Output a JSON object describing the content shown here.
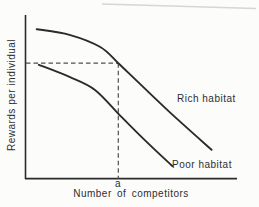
{
  "figure": {
    "background": "#fcfcfb",
    "line_color": "#2b2b2b",
    "dash_color": "#4f4f4f",
    "text_color": "#2e2e2e",
    "scan_artifact_color": "#d2d2d2"
  },
  "chart_data": {
    "type": "line",
    "title": "",
    "xlabel": "Number of competitors",
    "ylabel": "Rewards per individual",
    "xlim": [
      0,
      10
    ],
    "ylim": [
      0,
      10
    ],
    "grid": false,
    "axes_numeric": false,
    "legend_position": "labels-beside-curves",
    "series": [
      {
        "name": "Rich habitat",
        "x": [
          0.55,
          2.1,
          3.55,
          4.4,
          5.4,
          6.85,
          8.8
        ],
        "y": [
          9.25,
          8.9,
          8.15,
          7.15,
          5.9,
          4.1,
          1.8
        ]
      },
      {
        "name": "Poor habitat",
        "x": [
          0.65,
          2.1,
          3.3,
          4.5,
          5.65,
          6.95
        ],
        "y": [
          7.05,
          6.3,
          5.5,
          3.9,
          2.4,
          0.8
        ]
      }
    ],
    "annotations": {
      "x_marker": {
        "label": "a",
        "x": 4.4,
        "y_at_rich_curve": 7.15
      },
      "dashed_lines": "horizontal from y-axis at y=7.15 to rich curve, then vertical down to x-axis at x=a"
    }
  }
}
